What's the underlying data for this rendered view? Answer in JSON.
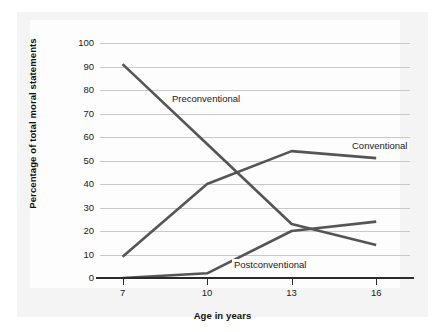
{
  "chart_data": {
    "type": "line",
    "title": "",
    "xlabel": "Age in years",
    "ylabel": "Percentage of total moral statements",
    "x": [
      7,
      10,
      13,
      16
    ],
    "xtick_labels": [
      "7",
      "10",
      "13",
      "16"
    ],
    "ytick_labels": [
      "100",
      "90",
      "80",
      "70",
      "60",
      "50",
      "40",
      "30",
      "20",
      "10",
      "0"
    ],
    "yticks": [
      100,
      90,
      80,
      70,
      60,
      50,
      40,
      30,
      20,
      10,
      0
    ],
    "xlim": [
      6.2,
      17.2
    ],
    "ylim": [
      0,
      100
    ],
    "grid": true,
    "legend_position": "inline-annotations",
    "series": [
      {
        "name": "Preconventional",
        "color": "#555555",
        "values": [
          91,
          57,
          23,
          14
        ]
      },
      {
        "name": "Conventional",
        "color": "#555555",
        "values": [
          9,
          40,
          54,
          51
        ]
      },
      {
        "name": "Postconventional",
        "color": "#555555",
        "values": [
          0,
          2,
          20,
          24
        ]
      }
    ],
    "annotations": [
      {
        "text": "Preconventional",
        "series": "Preconventional"
      },
      {
        "text": "Conventional",
        "series": "Conventional"
      },
      {
        "text": "Postconventional",
        "series": "Postconventional"
      }
    ]
  },
  "colors": {
    "line": "#555555",
    "gridline": "#c9c9c9",
    "axis": "#2b2b2b",
    "plate": "#f4f4f4",
    "canvas": "#fdfdfd",
    "text": "#1a1a1a"
  }
}
